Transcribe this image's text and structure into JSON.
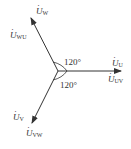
{
  "diagram": {
    "type": "phasor",
    "stroke_color": "#333333",
    "phasors": [
      {
        "id": "U",
        "main": "U",
        "sub": "U",
        "line_sub": "UV",
        "direction_deg": 0
      },
      {
        "id": "W",
        "main": "U",
        "sub": "W",
        "line_sub": "WU",
        "direction_deg": 120
      },
      {
        "id": "V",
        "main": "U",
        "sub": "V",
        "line_sub": "VW",
        "direction_deg": 240
      }
    ],
    "angle_labels": [
      "120°",
      "120°"
    ]
  }
}
